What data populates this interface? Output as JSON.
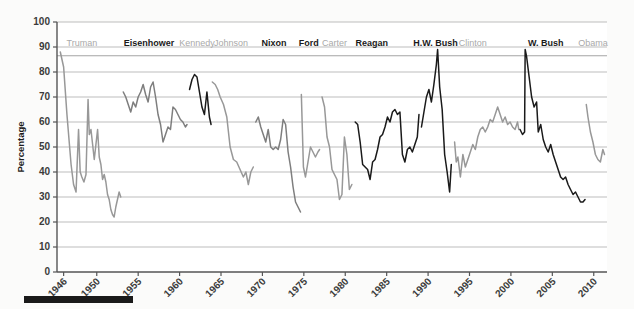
{
  "chart_data": {
    "type": "line",
    "title": "",
    "xlabel": "",
    "ylabel": "Percentage",
    "xlim": [
      1945.2,
      2011.6
    ],
    "ylim": [
      0,
      100
    ],
    "grid": true,
    "legend_position": "none",
    "y_ticks": [
      0,
      10,
      20,
      30,
      40,
      50,
      60,
      70,
      80,
      90,
      100
    ],
    "x_ticks": [
      1946,
      1950,
      1955,
      1960,
      1965,
      1970,
      1975,
      1980,
      1985,
      1990,
      1995,
      2000,
      2005,
      2010
    ],
    "colors": {
      "republican": "#1a1a1a",
      "democrat": "#989898",
      "gridline": "#b6b6b6",
      "axis": "#555555",
      "background": "#fbfbfa",
      "label_republican": "#1a1a1a",
      "label_democrat": "#a9a9a9"
    },
    "annotations": [
      {
        "name": "era-band-rule",
        "type": "horizontal-line",
        "y_value": 86.5
      }
    ],
    "series": [
      {
        "name": "Truman",
        "party": "Democrat",
        "color": "#989898",
        "label_x": 1948.2,
        "x": [
          1945.6,
          1946.0,
          1946.4,
          1946.9,
          1947.2,
          1947.5,
          1947.8,
          1948.0,
          1948.2,
          1948.45,
          1948.7,
          1948.95,
          1949.1,
          1949.3,
          1949.5,
          1949.7,
          1949.9,
          1950.1,
          1950.3,
          1950.5,
          1950.7,
          1950.9,
          1951.1,
          1951.3,
          1951.5,
          1951.7,
          1951.9,
          1952.1,
          1952.3,
          1952.5,
          1952.7,
          1952.9
        ],
        "values": [
          88,
          82,
          63,
          43,
          35,
          32,
          57,
          40,
          38,
          36,
          39,
          69,
          55,
          57,
          51,
          45,
          51,
          57,
          46,
          43,
          37,
          39,
          36,
          31,
          29,
          25,
          23,
          22,
          26,
          29,
          32,
          30
        ]
      },
      {
        "name": "Eisenhower",
        "party": "Republican",
        "color": "#7e7e7e",
        "label_x": 1956.3,
        "x": [
          1953.2,
          1953.5,
          1953.8,
          1954.1,
          1954.4,
          1954.7,
          1955.0,
          1955.3,
          1955.6,
          1955.9,
          1956.2,
          1956.5,
          1956.8,
          1957.1,
          1957.4,
          1957.7,
          1958.0,
          1958.3,
          1958.6,
          1958.9,
          1959.2,
          1959.5,
          1959.8,
          1960.1,
          1960.4,
          1960.7,
          1960.9
        ],
        "values": [
          72,
          70,
          67,
          64,
          68,
          66,
          70,
          72,
          75,
          71,
          68,
          74,
          76,
          70,
          63,
          59,
          52,
          55,
          58,
          57,
          66,
          65,
          63,
          61,
          60,
          58,
          59
        ]
      },
      {
        "name": "Kennedy",
        "party": "Democrat",
        "color": "#1a1a1a",
        "label_x": 1962.1,
        "x": [
          1961.2,
          1961.5,
          1961.8,
          1962.1,
          1962.4,
          1962.7,
          1963.0,
          1963.3,
          1963.6,
          1963.8
        ],
        "values": [
          73,
          77,
          79,
          78,
          72,
          66,
          63,
          72,
          62,
          59
        ]
      },
      {
        "name": "Johnson",
        "party": "Democrat",
        "color": "#989898",
        "label_x": 1966.2,
        "x": [
          1963.95,
          1964.3,
          1964.6,
          1964.9,
          1965.3,
          1965.7,
          1966.1,
          1966.5,
          1966.9,
          1967.3,
          1967.7,
          1968.0,
          1968.3,
          1968.6,
          1968.9
        ],
        "values": [
          76,
          75,
          73,
          70,
          67,
          62,
          50,
          45,
          44,
          41,
          38,
          40,
          35,
          40,
          42
        ]
      },
      {
        "name": "Nixon",
        "party": "Republican",
        "color": "#7e7e7e",
        "label_x": 1971.4,
        "x": [
          1969.2,
          1969.5,
          1969.8,
          1970.1,
          1970.4,
          1970.7,
          1971.0,
          1971.3,
          1971.6,
          1971.9,
          1972.2,
          1972.5,
          1972.8,
          1973.1,
          1973.4,
          1973.7,
          1974.0,
          1974.3,
          1974.6
        ],
        "values": [
          60,
          62,
          58,
          55,
          52,
          57,
          50,
          49,
          50,
          49,
          53,
          61,
          59,
          48,
          42,
          34,
          28,
          26,
          24
        ]
      },
      {
        "name": "Ford",
        "party": "Republican",
        "color": "#989898",
        "label_x": 1975.6,
        "x": [
          1974.7,
          1974.95,
          1975.2,
          1975.5,
          1975.8,
          1976.1,
          1976.4,
          1976.7,
          1976.9
        ],
        "values": [
          71,
          42,
          38,
          44,
          50,
          48,
          46,
          48,
          49
        ]
      },
      {
        "name": "Carter",
        "party": "Democrat",
        "color": "#989898",
        "label_x": 1978.7,
        "x": [
          1977.2,
          1977.5,
          1977.8,
          1978.1,
          1978.4,
          1978.7,
          1979.0,
          1979.3,
          1979.6,
          1979.9,
          1980.2,
          1980.5,
          1980.8
        ],
        "values": [
          70,
          66,
          54,
          50,
          41,
          39,
          37,
          29,
          31,
          54,
          47,
          33,
          35
        ]
      },
      {
        "name": "Reagan",
        "party": "Republican",
        "color": "#1a1a1a",
        "label_x": 1983.2,
        "x": [
          1981.2,
          1981.5,
          1981.8,
          1982.1,
          1982.4,
          1982.7,
          1983.0,
          1983.3,
          1983.6,
          1983.9,
          1984.2,
          1984.5,
          1984.8,
          1985.1,
          1985.4,
          1985.7,
          1986.0,
          1986.3,
          1986.6,
          1986.9,
          1987.2,
          1987.5,
          1987.8,
          1988.1,
          1988.4,
          1988.7,
          1988.9
        ],
        "values": [
          60,
          59,
          52,
          43,
          42,
          41,
          37,
          44,
          45,
          49,
          54,
          55,
          58,
          62,
          60,
          64,
          65,
          63,
          64,
          47,
          44,
          49,
          50,
          48,
          51,
          54,
          63
        ]
      },
      {
        "name": "H.W. Bush",
        "party": "Republican",
        "color": "#1a1a1a",
        "label_x": 1990.9,
        "x": [
          1989.2,
          1989.5,
          1989.8,
          1990.1,
          1990.4,
          1990.7,
          1991.0,
          1991.15,
          1991.4,
          1991.7,
          1992.0,
          1992.3,
          1992.6,
          1992.8
        ],
        "values": [
          58,
          64,
          70,
          73,
          68,
          75,
          83,
          89,
          74,
          65,
          47,
          40,
          32,
          43
        ]
      },
      {
        "name": "Clinton",
        "party": "Democrat",
        "color": "#989898",
        "label_x": 1995.4,
        "x": [
          1993.2,
          1993.4,
          1993.6,
          1993.9,
          1994.2,
          1994.5,
          1994.8,
          1995.1,
          1995.4,
          1995.7,
          1996.0,
          1996.3,
          1996.6,
          1996.9,
          1997.2,
          1997.5,
          1997.8,
          1998.1,
          1998.4,
          1998.7,
          1999.0,
          1999.3,
          1999.6,
          1999.9,
          2000.2,
          2000.5,
          2000.8,
          2000.95
        ],
        "values": [
          52,
          44,
          46,
          38,
          47,
          42,
          45,
          48,
          51,
          49,
          54,
          57,
          58,
          56,
          58,
          61,
          60,
          63,
          66,
          63,
          60,
          62,
          59,
          60,
          58,
          57,
          60,
          57
        ]
      },
      {
        "name": "W. Bush",
        "party": "Republican",
        "color": "#1a1a1a",
        "label_x": 2004.2,
        "x": [
          2001.1,
          2001.4,
          2001.65,
          2001.72,
          2001.9,
          2002.2,
          2002.5,
          2002.8,
          2003.1,
          2003.3,
          2003.6,
          2003.9,
          2004.2,
          2004.5,
          2004.8,
          2005.1,
          2005.4,
          2005.7,
          2006.0,
          2006.3,
          2006.6,
          2006.9,
          2007.2,
          2007.5,
          2007.8,
          2008.1,
          2008.4,
          2008.7,
          2008.95
        ],
        "values": [
          57,
          55,
          56,
          89,
          86,
          78,
          70,
          66,
          68,
          56,
          59,
          53,
          50,
          48,
          51,
          47,
          44,
          41,
          38,
          37,
          38,
          35,
          33,
          31,
          32,
          30,
          28,
          28,
          29
        ]
      },
      {
        "name": "Obama",
        "party": "Democrat",
        "color": "#989898",
        "label_x": 2009.9,
        "x": [
          2009.1,
          2009.3,
          2009.6,
          2009.9,
          2010.2,
          2010.5,
          2010.8,
          2011.1,
          2011.3
        ],
        "values": [
          67,
          62,
          56,
          52,
          47,
          45,
          44,
          49,
          47
        ]
      }
    ],
    "presidents": [
      {
        "name": "Truman",
        "party": "Democrat"
      },
      {
        "name": "Eisenhower",
        "party": "Republican"
      },
      {
        "name": "Kennedy",
        "party": "Democrat"
      },
      {
        "name": "Johnson",
        "party": "Democrat"
      },
      {
        "name": "Nixon",
        "party": "Republican"
      },
      {
        "name": "Ford",
        "party": "Republican"
      },
      {
        "name": "Carter",
        "party": "Democrat"
      },
      {
        "name": "Reagan",
        "party": "Republican"
      },
      {
        "name": "H.W. Bush",
        "party": "Republican"
      },
      {
        "name": "Clinton",
        "party": "Democrat"
      },
      {
        "name": "W. Bush",
        "party": "Republican"
      },
      {
        "name": "Obama",
        "party": "Democrat"
      }
    ]
  },
  "footer": {
    "bar_present": true
  }
}
